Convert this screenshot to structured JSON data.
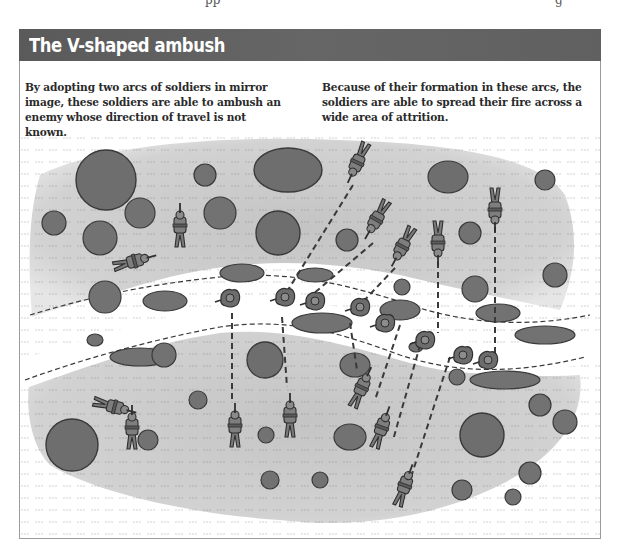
{
  "page": {
    "cut_off_header_fragments": [
      "pp",
      "g"
    ]
  },
  "figure": {
    "title": "The V-shaped ambush",
    "title_bar_color": "#606060",
    "title_text_color": "#ffffff",
    "border_color": "#9a9a9a",
    "captions": {
      "left": "By adopting two arcs of soldiers in mirror image, these soldiers are able to ambush an enemy whose direction of travel is not known.",
      "right": "Because of their formation in these arcs, the soldiers are able to spread their fire across a wide area of attrition."
    },
    "illustration": {
      "description": "Top-down view of a track crossing terrain with two mirrored arcs of prone and kneeling soldiers on either side; dashed fire lines converge on enemy soldiers moving along the track",
      "colors": {
        "ground": "#c9c9c9",
        "ground_light": "#dcdcdc",
        "track": "#ffffff",
        "bush": "#6e6e6e",
        "bush_outline": "#3a3a3a",
        "soldier": "#7a7a7a",
        "soldier_outline": "#2f2f2f",
        "fire_line": "#3a3a3a"
      },
      "elements": {
        "north_arc_soldiers": 8,
        "south_arc_soldiers": 8,
        "enemy_soldiers_on_track": 10,
        "fire_lines": 12
      }
    }
  }
}
